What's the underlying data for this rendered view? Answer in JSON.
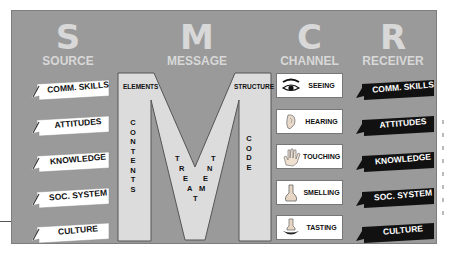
{
  "colors": {
    "panel": "#9a9a9a",
    "header_text": "#d8d8d8",
    "m_fill": "#dcdcdc",
    "source_flag": "#ffffff",
    "receiver_flag": "#111111"
  },
  "columns": {
    "source": {
      "letter": "S",
      "label": "SOURCE"
    },
    "message": {
      "letter": "M",
      "label": "MESSAGE"
    },
    "channel": {
      "letter": "C",
      "label": "CHANNEL"
    },
    "receiver": {
      "letter": "R",
      "label": "RECEIVER"
    }
  },
  "source_items": [
    "COMM. SKILLS",
    "ATTITUDES",
    "KNOWLEDGE",
    "SOC. SYSTEM",
    "CULTURE"
  ],
  "receiver_items": [
    "COMM. SKILLS",
    "ATTITUDES",
    "KNOWLEDGE",
    "SOC. SYSTEM",
    "CULTURE"
  ],
  "message": {
    "elements": "ELEMENTS",
    "structure": "STRUCTURE",
    "contents": [
      "C",
      "O",
      "N",
      "T",
      "E",
      "N",
      "T",
      "S"
    ],
    "code": [
      "C",
      "O",
      "D",
      "E"
    ],
    "treatment_left": [
      "T",
      "R",
      "E",
      "A",
      "T"
    ],
    "treatment_right": [
      "M",
      "E",
      "N",
      "T"
    ]
  },
  "channel_items": [
    {
      "label": "SEEING",
      "icon": "eye-icon"
    },
    {
      "label": "HEARING",
      "icon": "ear-icon"
    },
    {
      "label": "TOUCHING",
      "icon": "hand-icon"
    },
    {
      "label": "SMELLING",
      "icon": "nose-icon"
    },
    {
      "label": "TASTING",
      "icon": "tongue-icon"
    }
  ]
}
